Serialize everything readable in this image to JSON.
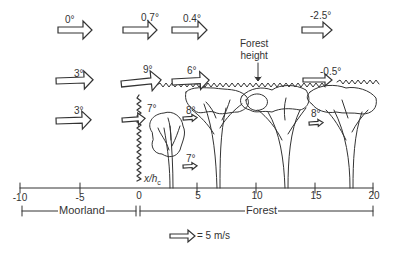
{
  "diagram": {
    "stroke_color": "#333333",
    "background": "#ffffff",
    "axis": {
      "label": "x/h",
      "label_subscript": "c",
      "ticks": [
        {
          "value": "-10",
          "x": 20
        },
        {
          "value": "-5",
          "x": 80
        },
        {
          "value": "0",
          "x": 139
        },
        {
          "value": "5",
          "x": 197
        },
        {
          "value": "10",
          "x": 256
        },
        {
          "value": "15",
          "x": 315
        },
        {
          "value": "20",
          "x": 373
        }
      ]
    },
    "zones": {
      "moorland": "Moorland",
      "forest": "Forest"
    },
    "forest_height_label": [
      "Forest",
      "height"
    ],
    "legend": {
      "text": "= 5 m/s"
    },
    "arrows": [
      {
        "id": "a1",
        "angle": "0°",
        "x": 58,
        "y": 30,
        "size": "large"
      },
      {
        "id": "a2",
        "angle": "0.7°",
        "x": 123,
        "y": 30,
        "size": "large"
      },
      {
        "id": "a3",
        "angle": "0.4°",
        "x": 172,
        "y": 30,
        "size": "large"
      },
      {
        "id": "a4",
        "angle": "-2.5°",
        "x": 302,
        "y": 30,
        "size": "medium"
      },
      {
        "id": "a5",
        "angle": "3°",
        "x": 56,
        "y": 80,
        "size": "large"
      },
      {
        "id": "a6",
        "angle": "9°",
        "x": 121,
        "y": 79,
        "size": "xlarge"
      },
      {
        "id": "a7",
        "angle": "6°",
        "x": 172,
        "y": 79,
        "size": "large"
      },
      {
        "id": "a8",
        "angle": "-0.5°",
        "x": 303,
        "y": 79,
        "size": "medium"
      },
      {
        "id": "a9",
        "angle": "3°",
        "x": 56,
        "y": 120,
        "size": "large"
      },
      {
        "id": "a10",
        "angle": "7°",
        "x": 122,
        "y": 117,
        "size": "medium"
      },
      {
        "id": "a11",
        "angle": "8°",
        "x": 183,
        "y": 116,
        "size": "small"
      },
      {
        "id": "a12",
        "angle": "8°",
        "x": 309,
        "y": 121,
        "size": "small"
      },
      {
        "id": "a13",
        "angle": "7°",
        "x": 183,
        "y": 164,
        "size": "small"
      }
    ]
  }
}
